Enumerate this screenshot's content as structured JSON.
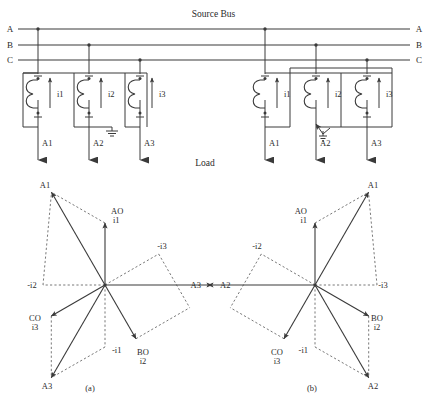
{
  "figure": {
    "title": "Source Bus",
    "load_label": "Load",
    "bus_lines": [
      {
        "name": "A",
        "left_label": "A",
        "right_label": "A"
      },
      {
        "name": "B",
        "left_label": "B",
        "right_label": "B"
      },
      {
        "name": "C",
        "left_label": "C",
        "right_label": "C"
      }
    ],
    "captions": [
      {
        "id": "a",
        "text": "(a)"
      },
      {
        "id": "b",
        "text": "(b)"
      }
    ]
  },
  "circuits": [
    {
      "id": "circuit-a",
      "ground_type": "solid-ground",
      "cts": [
        {
          "current_label": "i1",
          "terminal_label": "A1"
        },
        {
          "current_label": "i2",
          "terminal_label": "A2"
        },
        {
          "current_label": "i3",
          "terminal_label": "A3"
        }
      ]
    },
    {
      "id": "circuit-b",
      "ground_type": "arrow-ground",
      "cts": [
        {
          "current_label": "i1",
          "terminal_label": "A1"
        },
        {
          "current_label": "i2",
          "terminal_label": "A2"
        },
        {
          "current_label": "i3",
          "terminal_label": "A3"
        }
      ]
    }
  ],
  "phasor_diagrams": [
    {
      "id": "phasor-a",
      "caption": "(a)",
      "solid_vectors": [
        {
          "name": "AO",
          "label_line1": "AO",
          "label_line2": "i1",
          "angle_deg": 90,
          "length": 62
        },
        {
          "name": "BO",
          "label_line1": "BO",
          "label_line2": "i2",
          "angle_deg": -60,
          "length": 62
        },
        {
          "name": "CO",
          "label_line1": "CO",
          "label_line2": "i3",
          "angle_deg": 210,
          "length": 62
        },
        {
          "name": "A1",
          "label_line1": "A1",
          "label_line2": "",
          "angle_deg": 120,
          "length": 107
        },
        {
          "name": "A2",
          "label_line1": "A2",
          "label_line2": "",
          "angle_deg": 0,
          "length": 107
        },
        {
          "name": "A3",
          "label_line1": "A3",
          "label_line2": "",
          "angle_deg": 240,
          "length": 107
        }
      ],
      "dashed_vectors": [
        {
          "name": "-i2",
          "label": "-i2",
          "angle_deg": 180,
          "length": 62
        },
        {
          "name": "-i3",
          "label": "-i3",
          "angle_deg": 30,
          "length": 62
        },
        {
          "name": "-i1",
          "label": "-i1",
          "angle_deg": -90,
          "length": 62
        }
      ]
    },
    {
      "id": "phasor-b",
      "caption": "(b)",
      "solid_vectors": [
        {
          "name": "AO",
          "label_line1": "AO",
          "label_line2": "i1",
          "angle_deg": 90,
          "length": 62
        },
        {
          "name": "BO",
          "label_line1": "BO",
          "label_line2": "i2",
          "angle_deg": -30,
          "length": 62
        },
        {
          "name": "CO",
          "label_line1": "CO",
          "label_line2": "i3",
          "angle_deg": 240,
          "length": 62
        },
        {
          "name": "A1",
          "label_line1": "A1",
          "label_line2": "",
          "angle_deg": 60,
          "length": 107
        },
        {
          "name": "A2",
          "label_line1": "A2",
          "label_line2": "",
          "angle_deg": -60,
          "length": 107
        },
        {
          "name": "A3",
          "label_line1": "A3",
          "label_line2": "",
          "angle_deg": 180,
          "length": 107
        }
      ],
      "dashed_vectors": [
        {
          "name": "-i2",
          "label": "-i2",
          "angle_deg": 150,
          "length": 62
        },
        {
          "name": "-i3",
          "label": "-i3",
          "angle_deg": 0,
          "length": 62
        },
        {
          "name": "-i1",
          "label": "-i1",
          "angle_deg": -90,
          "length": 62
        }
      ]
    }
  ],
  "colors": {
    "line": "#3a3a3a",
    "dash": "#6a6a6a",
    "text": "#2b2b2b",
    "background": "#ffffff"
  }
}
